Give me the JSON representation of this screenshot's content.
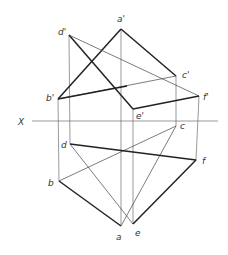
{
  "diagram": {
    "axis_label": "X",
    "labels": {
      "a_prime": "a'",
      "b_prime": "b'",
      "c_prime": "c'",
      "d_prime": "d'",
      "e_prime": "e'",
      "f_prime": "f'",
      "a": "a",
      "b": "b",
      "c": "c",
      "d": "d",
      "e": "e",
      "f": "f"
    },
    "points": {
      "a_prime": [
        121,
        29
      ],
      "b_prime": [
        58,
        99
      ],
      "c_prime": [
        176,
        76
      ],
      "d_prime": [
        69,
        35
      ],
      "e_prime": [
        133,
        109
      ],
      "f_prime": [
        199,
        96
      ],
      "a": [
        121,
        226
      ],
      "b": [
        59,
        181
      ],
      "c": [
        176,
        126
      ],
      "d": [
        70,
        144
      ],
      "e": [
        133,
        224
      ],
      "f": [
        196,
        160
      ]
    },
    "x_axis": {
      "y": 121,
      "x1": 32,
      "x2": 218
    }
  }
}
